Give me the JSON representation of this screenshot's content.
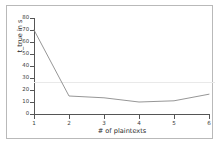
{
  "figure": {
    "background_color": "#ffffff",
    "border_color": "#b9b9b9",
    "line_color": "#8a8a8a",
    "axis_color": "#555555",
    "reference_line_color": "#e9e9e9"
  },
  "chart_data": {
    "type": "line",
    "title": "",
    "xlabel": "# of plaintexts",
    "ylabel": "t_true in s",
    "x": [
      1,
      2,
      3,
      4,
      5,
      6
    ],
    "values": [
      70,
      15,
      13.5,
      10,
      11,
      16.5
    ],
    "series": [
      {
        "name": "t_true",
        "values": [
          70,
          15,
          13.5,
          10,
          11,
          16.5
        ]
      }
    ],
    "xlim": [
      1,
      6
    ],
    "ylim": [
      0,
      80
    ],
    "xticks": [
      "1",
      "2",
      "3",
      "4",
      "5",
      "6"
    ],
    "yticks": [
      "0",
      "10",
      "20",
      "30",
      "40",
      "50",
      "60",
      "70",
      "80"
    ],
    "grid": false,
    "legend": null,
    "annotations": [
      {
        "type": "horizontal-reference-line",
        "y": 26.5,
        "label": ""
      }
    ]
  }
}
